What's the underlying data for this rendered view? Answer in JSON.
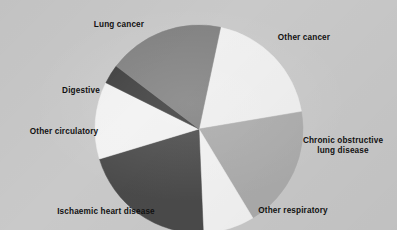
{
  "figure": {
    "background_color": "#c9c9c9",
    "label_color": "#111111"
  },
  "chart_data": {
    "type": "pie",
    "title": "",
    "subtitle": "",
    "xlabel": "",
    "ylabel": "",
    "grid": false,
    "legend_position": "none",
    "label_placement": "outside-radial",
    "start_angle_deg": 12,
    "direction": "clockwise",
    "center": {
      "x": 199,
      "y": 129
    },
    "radius": 104,
    "categories": [
      "Other cancer",
      "Chronic obstructive lung disease",
      "Other respiratory",
      "Ischaemic heart disease",
      "Other circulatory",
      "Digestive",
      "Lung cancer"
    ],
    "values": [
      19,
      19,
      8,
      21,
      12,
      3,
      18
    ],
    "colors": [
      "#efefef",
      "#ababab",
      "#f2f2f2",
      "#4a4a4a",
      "#f2f2f2",
      "#3c3c3c",
      "#808080"
    ],
    "slices": [
      {
        "label": "Other cancer",
        "label_text": "Other cancer",
        "value": 19,
        "color": "#efefef",
        "start_angle_deg": 12,
        "end_angle_deg": 80.4
      },
      {
        "label": "Chronic obstructive lung disease",
        "label_text": "Chronic obstructive\nlung disease",
        "value": 19,
        "color": "#ababab",
        "start_angle_deg": 80.4,
        "end_angle_deg": 148.8
      },
      {
        "label": "Other respiratory",
        "label_text": "Other respiratory",
        "value": 8,
        "color": "#f2f2f2",
        "start_angle_deg": 148.8,
        "end_angle_deg": 177.6
      },
      {
        "label": "Ischaemic heart disease",
        "label_text": "Ischaemic heart disease",
        "value": 21,
        "color": "#4a4a4a",
        "start_angle_deg": 177.6,
        "end_angle_deg": 253.2
      },
      {
        "label": "Other circulatory",
        "label_text": "Other circulatory",
        "value": 12,
        "color": "#f2f2f2",
        "start_angle_deg": 253.2,
        "end_angle_deg": 296.4
      },
      {
        "label": "Digestive",
        "label_text": "Digestive",
        "value": 3,
        "color": "#3c3c3c",
        "start_angle_deg": 296.4,
        "end_angle_deg": 307.2
      },
      {
        "label": "Lung cancer",
        "label_text": "Lung cancer",
        "value": 18,
        "color": "#808080",
        "start_angle_deg": 307.2,
        "end_angle_deg": 372
      }
    ]
  }
}
